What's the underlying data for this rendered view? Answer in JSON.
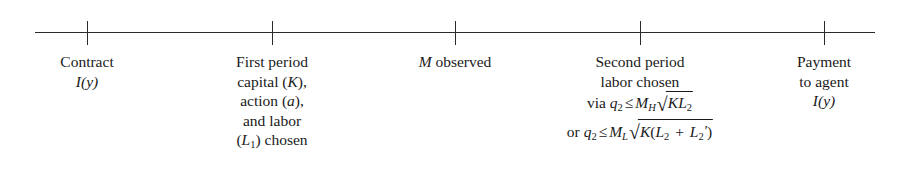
{
  "figure": {
    "type": "timeline",
    "title": "",
    "axis": {
      "start_x": 35,
      "end_x": 875,
      "y": 32,
      "color": "#2b2b2b",
      "tick_positions": [
        87,
        272,
        455,
        640,
        824
      ]
    },
    "events": [
      {
        "id": "contract",
        "tick_x": 87,
        "lines": [
          "Contract"
        ],
        "math_lines": [
          "I(y)"
        ]
      },
      {
        "id": "first-period",
        "tick_x": 272,
        "lines": [
          "First period",
          "capital (K),",
          "action (a),",
          "and labor",
          "(L1) chosen"
        ]
      },
      {
        "id": "m-observed",
        "tick_x": 455,
        "lines": [
          "M observed"
        ]
      },
      {
        "id": "second-period",
        "tick_x": 640,
        "lines": [
          "Second period",
          "labor chosen",
          "via q2 ≤ MH√(KL2)",
          "or q2 ≤ ML√(K(L2 + L2′))"
        ]
      },
      {
        "id": "payment",
        "tick_x": 824,
        "lines": [
          "Payment",
          "to agent"
        ],
        "math_lines": [
          "I(y)"
        ]
      }
    ]
  },
  "labels": {
    "contract": {
      "line1": "Contract",
      "var_I": "I",
      "paren_open": "(",
      "var_y": "y",
      "paren_close": ")"
    },
    "first_period": {
      "line1": "First period",
      "line2_pre": "capital (",
      "line2_var": "K",
      "line2_post": "),",
      "line3_pre": "action (",
      "line3_var": "a",
      "line3_post": "),",
      "line4": "and labor",
      "line5_pre": "(",
      "line5_var": "L",
      "line5_sub": "1",
      "line5_post": ") chosen"
    },
    "m_observed": {
      "var_M": "M",
      "text": " observed"
    },
    "second_period": {
      "line1": "Second period",
      "line2": "labor chosen",
      "f1_prefix": "via ",
      "f1_q": "q",
      "f1_q_sub": "2",
      "f1_op": "≤",
      "f1_M": "M",
      "f1_M_sub": "H",
      "f1_radical": "√",
      "f1_radicand_K": "K",
      "f1_radicand_L": "L",
      "f1_radicand_L_sub": "2",
      "f2_prefix": "or ",
      "f2_q": "q",
      "f2_q_sub": "2",
      "f2_op": "≤",
      "f2_M": "M",
      "f2_M_sub": "L",
      "f2_radical": "√",
      "f2_K": "K",
      "f2_open": "(",
      "f2_L1": "L",
      "f2_L1_sub": "2",
      "f2_plus": " + ",
      "f2_L2": "L",
      "f2_L2_sub": "2",
      "f2_prime": "′",
      "f2_close": ")"
    },
    "payment": {
      "line1": "Payment",
      "line2": "to agent",
      "var_I": "I",
      "paren_open": "(",
      "var_y": "y",
      "paren_close": ")"
    }
  }
}
